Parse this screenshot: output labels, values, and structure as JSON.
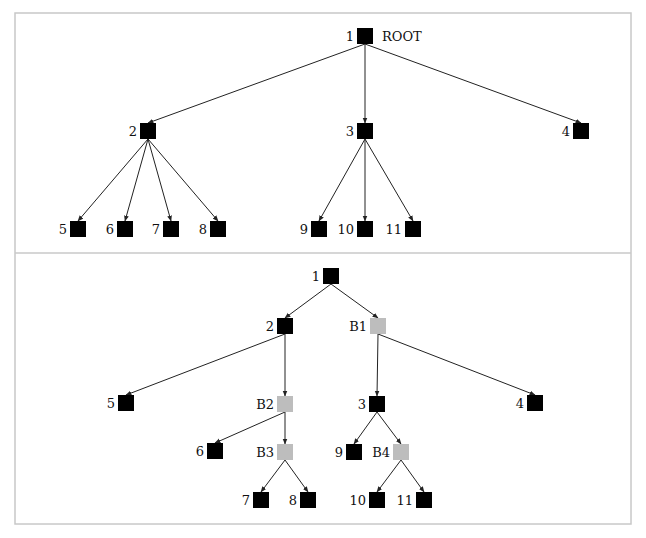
{
  "colors": {
    "regular_node": "#000000",
    "branch_node": "#bdbdbd",
    "edge": "#222222",
    "frame": "#c8c8c8"
  },
  "frame": {
    "x": 15,
    "y": 13,
    "width": 616,
    "height": 511,
    "divider_y": 253
  },
  "trees": [
    {
      "name": "original-tree",
      "nodes": [
        {
          "id": "t1",
          "label": "1",
          "annotation": "ROOT",
          "x": 357,
          "y": 28,
          "type": "regular"
        },
        {
          "id": "t2",
          "label": "2",
          "x": 140,
          "y": 123,
          "type": "regular"
        },
        {
          "id": "t3",
          "label": "3",
          "x": 357,
          "y": 123,
          "type": "regular"
        },
        {
          "id": "t4",
          "label": "4",
          "x": 573,
          "y": 123,
          "type": "regular"
        },
        {
          "id": "t5",
          "label": "5",
          "x": 70,
          "y": 221,
          "type": "regular"
        },
        {
          "id": "t6",
          "label": "6",
          "x": 117,
          "y": 221,
          "type": "regular"
        },
        {
          "id": "t7",
          "label": "7",
          "x": 163,
          "y": 221,
          "type": "regular"
        },
        {
          "id": "t8",
          "label": "8",
          "x": 210,
          "y": 221,
          "type": "regular"
        },
        {
          "id": "t9",
          "label": "9",
          "x": 311,
          "y": 221,
          "type": "regular"
        },
        {
          "id": "t10",
          "label": "10",
          "x": 357,
          "y": 221,
          "type": "regular"
        },
        {
          "id": "t11",
          "label": "11",
          "x": 405,
          "y": 221,
          "type": "regular"
        }
      ],
      "edges": [
        [
          "t1",
          "t2"
        ],
        [
          "t1",
          "t3"
        ],
        [
          "t1",
          "t4"
        ],
        [
          "t2",
          "t5"
        ],
        [
          "t2",
          "t6"
        ],
        [
          "t2",
          "t7"
        ],
        [
          "t2",
          "t8"
        ],
        [
          "t3",
          "t9"
        ],
        [
          "t3",
          "t10"
        ],
        [
          "t3",
          "t11"
        ]
      ]
    },
    {
      "name": "binarized-tree",
      "nodes": [
        {
          "id": "b1",
          "label": "1",
          "x": 323,
          "y": 268,
          "type": "regular"
        },
        {
          "id": "b2",
          "label": "2",
          "x": 277,
          "y": 318,
          "type": "regular"
        },
        {
          "id": "bB1",
          "label": "B1",
          "x": 370,
          "y": 318,
          "type": "branch"
        },
        {
          "id": "b5",
          "label": "5",
          "x": 118,
          "y": 395,
          "type": "regular"
        },
        {
          "id": "bB2",
          "label": "B2",
          "x": 277,
          "y": 396,
          "type": "branch"
        },
        {
          "id": "b3",
          "label": "3",
          "x": 369,
          "y": 396,
          "type": "regular"
        },
        {
          "id": "b4",
          "label": "4",
          "x": 527,
          "y": 395,
          "type": "regular"
        },
        {
          "id": "b6",
          "label": "6",
          "x": 207,
          "y": 443,
          "type": "regular"
        },
        {
          "id": "bB3",
          "label": "B3",
          "x": 277,
          "y": 444,
          "type": "branch"
        },
        {
          "id": "b9",
          "label": "9",
          "x": 346,
          "y": 444,
          "type": "regular"
        },
        {
          "id": "bB4",
          "label": "B4",
          "x": 393,
          "y": 444,
          "type": "branch"
        },
        {
          "id": "b7",
          "label": "7",
          "x": 253,
          "y": 492,
          "type": "regular"
        },
        {
          "id": "b8",
          "label": "8",
          "x": 300,
          "y": 492,
          "type": "regular"
        },
        {
          "id": "b10",
          "label": "10",
          "x": 369,
          "y": 492,
          "type": "regular"
        },
        {
          "id": "b11",
          "label": "11",
          "x": 416,
          "y": 492,
          "type": "regular"
        }
      ],
      "edges": [
        [
          "b1",
          "b2"
        ],
        [
          "b1",
          "bB1"
        ],
        [
          "b2",
          "b5"
        ],
        [
          "b2",
          "bB2"
        ],
        [
          "bB1",
          "b3"
        ],
        [
          "bB1",
          "b4"
        ],
        [
          "bB2",
          "b6"
        ],
        [
          "bB2",
          "bB3"
        ],
        [
          "b3",
          "b9"
        ],
        [
          "b3",
          "bB4"
        ],
        [
          "bB3",
          "b7"
        ],
        [
          "bB3",
          "b8"
        ],
        [
          "bB4",
          "b10"
        ],
        [
          "bB4",
          "b11"
        ]
      ]
    }
  ]
}
